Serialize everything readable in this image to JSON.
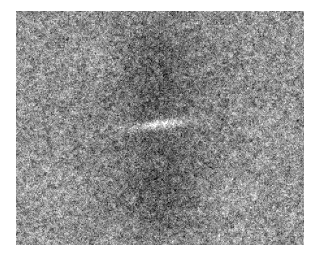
{
  "figure": {
    "kind": "grayscale-power-spectrum-image",
    "canvas_width": 319,
    "canvas_height": 259,
    "background_color": "#ffffff",
    "plot": {
      "x": 16,
      "y": 11,
      "width": 288,
      "height": 234,
      "border": "none",
      "colormap": "gray",
      "title": "",
      "xlabel": "",
      "ylabel": "",
      "axes_visible": false,
      "ticks_visible": false,
      "legend_visible": false,
      "colorbar_visible": false
    }
  },
  "chart_data": {
    "type": "heatmap",
    "title": "",
    "subtitle": "",
    "xlabel": "",
    "ylabel": "",
    "grid": false,
    "legend_position": "none",
    "colormap": "gray",
    "colormap_stops": [
      "#1e1e1e",
      "#6b6b6b",
      "#9a9a9a",
      "#c8c8c8",
      "#ffffff"
    ],
    "value_range": [
      0,
      255
    ],
    "mean_background_level": 138,
    "noise_sigma": 34,
    "noise_grain_px": 1.3,
    "nx": 288,
    "ny": 234,
    "xlim": [
      -144,
      144
    ],
    "ylim": [
      -117,
      117
    ],
    "center_px": [
      143,
      113
    ],
    "features": [
      {
        "name": "central-bright-streak",
        "shape": "horizontal-elongated-gaussian",
        "center": [
          143,
          113
        ],
        "sigma_x": 21,
        "sigma_y": 3.2,
        "rotation_deg": -7,
        "amplitude": 118,
        "peak_level": 252
      },
      {
        "name": "upper-dark-lobe",
        "shape": "vertical-elongated-gaussian",
        "center": [
          140,
          62
        ],
        "sigma_x": 30,
        "sigma_y": 41,
        "rotation_deg": 0,
        "amplitude": -42,
        "min_level": 92
      },
      {
        "name": "lower-dark-lobe",
        "shape": "vertical-elongated-gaussian",
        "center": [
          143,
          172
        ],
        "sigma_x": 29,
        "sigma_y": 44,
        "rotation_deg": 0,
        "amplitude": -44,
        "min_level": 90
      },
      {
        "name": "central-vertical-seam-line",
        "shape": "vertical-line",
        "x": 143,
        "width_px": 1,
        "delta_level": -16
      },
      {
        "name": "bright-halo-ring",
        "shape": "annulus",
        "center": [
          143,
          113
        ],
        "inner_radius": 78,
        "outer_radius": 150,
        "delta_level": 10
      },
      {
        "name": "bright-patch-upper-left",
        "shape": "gaussian-blob",
        "center": [
          82,
          46
        ],
        "sigma": 16,
        "delta_level": 22
      },
      {
        "name": "bright-patch-lower-right",
        "shape": "gaussian-blob",
        "center": [
          212,
          186
        ],
        "sigma": 18,
        "delta_level": 20
      },
      {
        "name": "bright-patch-right-mid",
        "shape": "gaussian-blob",
        "center": [
          252,
          126
        ],
        "sigma": 15,
        "delta_level": 16
      },
      {
        "name": "bright-patch-left-lower",
        "shape": "gaussian-blob",
        "center": [
          40,
          170
        ],
        "sigma": 17,
        "delta_level": 14
      }
    ]
  }
}
